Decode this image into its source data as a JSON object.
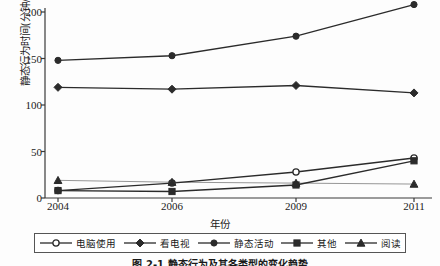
{
  "chart_data": {
    "type": "line",
    "title": "",
    "caption": "图 2-1   静态行为及其各类型的变化趋势",
    "xlabel": "年份",
    "ylabel": "静态行为时间(分钟/天)",
    "categories": [
      "2004",
      "2006",
      "2009",
      "2011"
    ],
    "x_tick_labels": [
      "2004",
      "2006",
      "2009",
      "2011"
    ],
    "y_tick_labels": [
      "0",
      "50",
      "100",
      "150",
      "200"
    ],
    "y_ticks": [
      0,
      50,
      100,
      150,
      200
    ],
    "ylim": [
      0,
      215
    ],
    "grid": false,
    "legend_position": "bottom",
    "series": [
      {
        "name": "电脑使用",
        "marker": "open-circle",
        "values": [
          8,
          16,
          28,
          43
        ]
      },
      {
        "name": "看电视",
        "marker": "diamond",
        "values": [
          119,
          117,
          121,
          113
        ]
      },
      {
        "name": "静态活动",
        "marker": "circle",
        "values": [
          148,
          153,
          174,
          208
        ]
      },
      {
        "name": "其他",
        "marker": "square",
        "values": [
          8,
          7,
          14,
          40
        ]
      },
      {
        "name": "阅读",
        "marker": "triangle",
        "values": [
          19,
          17,
          16,
          15
        ]
      }
    ]
  },
  "legend": {
    "items": [
      {
        "label": "电脑使用",
        "marker": "open-circle"
      },
      {
        "label": "看电视",
        "marker": "diamond"
      },
      {
        "label": "静态活动",
        "marker": "circle"
      },
      {
        "label": "其他",
        "marker": "square"
      },
      {
        "label": "阅读",
        "marker": "triangle"
      }
    ]
  },
  "colors": {
    "line": "#2b2b2b",
    "axis": "#3a3a3a",
    "background": "#fdfdfd",
    "text": "#1a1a1a"
  }
}
